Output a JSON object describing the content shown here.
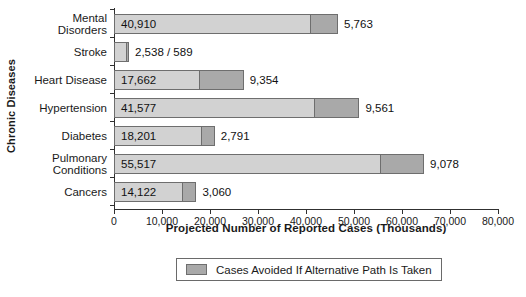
{
  "chart_data": {
    "type": "bar",
    "orientation": "horizontal",
    "stacked": true,
    "title": "",
    "xlabel": "Projected Number of Reported Cases (Thousands)",
    "ylabel": "Chronic Diseases",
    "xlim": [
      0,
      80000
    ],
    "xticks": [
      0,
      10000,
      20000,
      30000,
      40000,
      50000,
      60000,
      70000,
      80000
    ],
    "xticklabels": [
      "0",
      "10,000",
      "20,000",
      "30,000",
      "40,000",
      "50,000",
      "60,000",
      "70,000",
      "80,000"
    ],
    "grid": false,
    "legend": {
      "position": "bottom",
      "entries": [
        {
          "label": "Cases Avoided If Alternative Path Is Taken",
          "color": "#a9a9a9"
        }
      ]
    },
    "colors": {
      "base": "#d2d2d2",
      "avoided": "#a9a9a9",
      "border": "#6e6e6e",
      "axis": "#303030"
    },
    "categories": [
      "Mental Disorders",
      "Stroke",
      "Heart Disease",
      "Hypertension",
      "Diabetes",
      "Pulmonary Conditions",
      "Cancers"
    ],
    "series": [
      {
        "name": "Projected Reported Cases",
        "values": [
          40910,
          2538,
          17662,
          41577,
          18201,
          55517,
          14122
        ]
      },
      {
        "name": "Cases Avoided If Alternative Path Is Taken",
        "values": [
          5763,
          589,
          9354,
          9561,
          2791,
          9078,
          3060
        ]
      }
    ],
    "rows": [
      {
        "category_lines": [
          "Mental",
          "Disorders"
        ],
        "base_value": 40910,
        "avoided_value": 5763,
        "base_label": "40,910",
        "avoided_label": "5,763",
        "combined_label": ""
      },
      {
        "category_lines": [
          "Stroke"
        ],
        "base_value": 2538,
        "avoided_value": 589,
        "base_label": "",
        "avoided_label": "",
        "combined_label": "2,538 / 589"
      },
      {
        "category_lines": [
          "Heart Disease"
        ],
        "base_value": 17662,
        "avoided_value": 9354,
        "base_label": "17,662",
        "avoided_label": "9,354",
        "combined_label": ""
      },
      {
        "category_lines": [
          "Hypertension"
        ],
        "base_value": 41577,
        "avoided_value": 9561,
        "base_label": "41,577",
        "avoided_label": "9,561",
        "combined_label": ""
      },
      {
        "category_lines": [
          "Diabetes"
        ],
        "base_value": 18201,
        "avoided_value": 2791,
        "base_label": "18,201",
        "avoided_label": "2,791",
        "combined_label": ""
      },
      {
        "category_lines": [
          "Pulmonary",
          "Conditions"
        ],
        "base_value": 55517,
        "avoided_value": 9078,
        "base_label": "55,517",
        "avoided_label": "9,078",
        "combined_label": ""
      },
      {
        "category_lines": [
          "Cancers"
        ],
        "base_value": 14122,
        "avoided_value": 3060,
        "base_label": "14,122",
        "avoided_label": "3,060",
        "combined_label": ""
      }
    ]
  }
}
